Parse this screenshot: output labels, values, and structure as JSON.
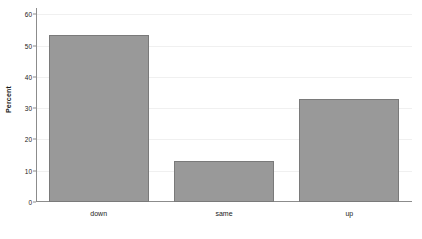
{
  "chart_data": {
    "type": "bar",
    "title": "",
    "subtitle": "",
    "xlabel": "",
    "ylabel": "Percent",
    "categories": [
      "down",
      "same",
      "up"
    ],
    "values": [
      53.3,
      13.1,
      32.8
    ],
    "series": [
      {
        "name": "Percent",
        "values": [
          53.3,
          13.1,
          32.8
        ]
      }
    ],
    "ylim": [
      0,
      62
    ],
    "yticks": [
      0,
      10,
      20,
      30,
      40,
      50,
      60
    ],
    "ytick_labels": [
      "0",
      "10",
      "20",
      "30",
      "40",
      "50",
      "60"
    ],
    "grid": true,
    "grid_axis": "y",
    "legend": false,
    "legend_position": "none",
    "bar_color": "#999999",
    "bar_edge_color": "#7a7a7a",
    "gridline_color": "#f0f0f0",
    "axis_color": "#8c8c8c",
    "background_color": "#ffffff",
    "text_color": "#1a1a1a"
  }
}
